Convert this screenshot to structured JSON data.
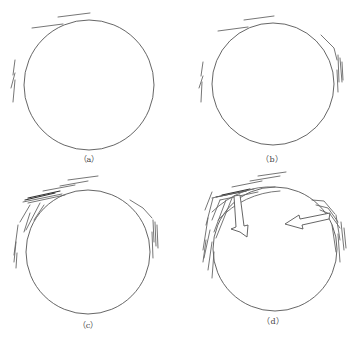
{
  "figure": {
    "panels": [
      {
        "id": "a",
        "label": "（a）",
        "description": "Circle with initial crack segments at top-left and left"
      },
      {
        "id": "b",
        "label": "（b）",
        "description": "Circle with cracks at top-left, left, and right side"
      },
      {
        "id": "c",
        "label": "（c）",
        "description": "Circle with densified cracks at top-left and right side"
      },
      {
        "id": "d",
        "label": "（d）",
        "description": "Circle with dense cracks and two hollow arrows pointing inward"
      }
    ],
    "colors": {
      "stroke": "#555555",
      "background": "#ffffff"
    }
  }
}
